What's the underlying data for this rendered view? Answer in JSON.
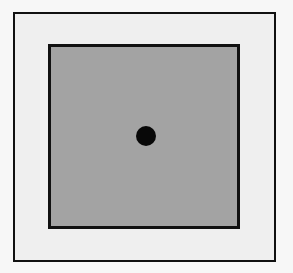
{
  "diagram": {
    "outer_square": {
      "fill": "#efefef",
      "stroke": "#111111"
    },
    "inner_square": {
      "fill": "#a3a3a3",
      "stroke": "#111111"
    },
    "center_dot": {
      "fill": "#080808"
    }
  }
}
